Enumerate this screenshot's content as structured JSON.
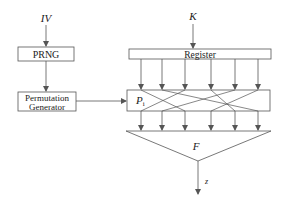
{
  "diagram": {
    "inputs": {
      "iv_label": "IV",
      "k_label": "K"
    },
    "blocks": {
      "prng": "PRNG",
      "perm_gen_line1": "Permutation",
      "perm_gen_line2": "Generator",
      "register": "Register",
      "permutation_label": "P",
      "permutation_subscript": "i",
      "function_label": "F"
    },
    "output_label": "z",
    "colors": {
      "stroke": "#555555",
      "text": "#222222",
      "background": "#ffffff"
    },
    "register_taps_x": [
      141,
      162,
      185,
      211,
      235,
      258
    ],
    "permutation_map": [
      [
        141,
        185
      ],
      [
        162,
        258
      ],
      [
        185,
        141
      ],
      [
        211,
        235
      ],
      [
        235,
        162
      ],
      [
        258,
        211
      ]
    ]
  }
}
